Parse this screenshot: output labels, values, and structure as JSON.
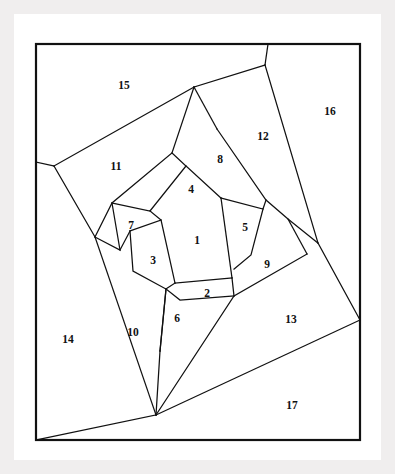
{
  "figure": {
    "background_color": "#f0eeee",
    "paper_color": "#ffffff",
    "line_color": "#111111",
    "region_count": 17,
    "frame": {
      "x": 36,
      "y": 44,
      "width": 324,
      "height": 396
    }
  },
  "chart_data": {
    "type": "diagram",
    "categories": [
      "1",
      "2",
      "3",
      "4",
      "5",
      "6",
      "7",
      "8",
      "9",
      "10",
      "11",
      "12",
      "13",
      "14",
      "15",
      "16",
      "17"
    ],
    "values": [
      1,
      2,
      3,
      4,
      5,
      6,
      7,
      8,
      9,
      10,
      11,
      12,
      13,
      14,
      15,
      16,
      17
    ],
    "xlabel": "",
    "ylabel": "",
    "grid": false,
    "legend": "none"
  },
  "regions": [
    {
      "id": "1",
      "label": "1",
      "label_x": 197,
      "label_y": 241,
      "points": "161,220 221,198 232,278 175,283"
    },
    {
      "id": "2",
      "label": "2",
      "label_x": 207,
      "label_y": 294,
      "points": "175,283 232,278 234,296 180,300 166,289"
    },
    {
      "id": "3",
      "label": "3",
      "label_x": 153,
      "label_y": 261,
      "points": "130,231 161,220 175,283 166,289 133,271"
    },
    {
      "id": "4",
      "label": "4",
      "label_x": 191,
      "label_y": 190,
      "points": "150,211 186,166 221,198 161,220"
    },
    {
      "id": "5",
      "label": "5",
      "label_x": 245,
      "label_y": 228,
      "points": "221,198 263,209 251,255 234,269"
    },
    {
      "id": "6",
      "label": "6",
      "label_x": 177,
      "label_y": 319,
      "points": "166,289 180,300 234,296 206,330 160,351"
    },
    {
      "id": "7",
      "label": "7",
      "label_x": 131,
      "label_y": 226,
      "points": "112,203 172,153 186,166 150,211 130,231 120,250"
    },
    {
      "id": "8",
      "label": "8",
      "label_x": 220,
      "label_y": 160,
      "points": "186,166 217,129 266,200 263,209 221,198"
    },
    {
      "id": "9",
      "label": "9",
      "label_x": 267,
      "label_y": 265,
      "points": "263,209 288,219 307,254 234,296 251,255"
    },
    {
      "id": "10",
      "label": "10",
      "label_x": 133,
      "label_y": 333,
      "points": "95,237 120,250 130,231 133,271 166,289 160,351 156,415"
    },
    {
      "id": "11",
      "label": "11",
      "label_x": 116,
      "label_y": 167,
      "points": "54,166 194,87 172,153 112,203 95,237"
    },
    {
      "id": "12",
      "label": "12",
      "label_x": 263,
      "label_y": 137,
      "points": "217,129 265,65 318,243 288,219 266,200"
    },
    {
      "id": "13",
      "label": "13",
      "label_x": 291,
      "label_y": 320,
      "points": "307,254 318,243 360,320 156,415"
    },
    {
      "id": "14",
      "label": "14",
      "label_x": 68,
      "label_y": 340,
      "points": "36,162 54,166 95,237 156,415 36,440"
    },
    {
      "id": "15",
      "label": "15",
      "label_x": 124,
      "label_y": 86,
      "points": "36,44 268,44 265,65 194,87 54,166 36,162"
    },
    {
      "id": "16",
      "label": "16",
      "label_x": 330,
      "label_y": 112,
      "points": "268,44 360,44 360,320 318,243 265,65"
    },
    {
      "id": "17",
      "label": "17",
      "label_x": 292,
      "label_y": 406,
      "points": "360,320 360,440 36,440 156,415"
    }
  ],
  "edges": [
    {
      "name": "frame-top",
      "d": "M36,44 L360,44"
    },
    {
      "name": "frame-right",
      "d": "M360,44 L360,440"
    },
    {
      "name": "frame-bottom",
      "d": "M360,440 L36,440"
    },
    {
      "name": "frame-left",
      "d": "M36,440 L36,44"
    },
    {
      "name": "edge-15-11",
      "d": "M54,166 L194,87"
    },
    {
      "name": "edge-15-12",
      "d": "M194,87 L265,65"
    },
    {
      "name": "edge-15-16",
      "d": "M265,65 L268,44"
    },
    {
      "name": "edge-12-16",
      "d": "M265,65 L318,243"
    },
    {
      "name": "edge-13-16",
      "d": "M318,243 L360,320"
    },
    {
      "name": "edge-13-17",
      "d": "M360,320 L156,415"
    },
    {
      "name": "edge-17-14",
      "d": "M156,415 L36,440"
    },
    {
      "name": "edge-14-11",
      "d": "M36,162 L54,166"
    },
    {
      "name": "edge-11-14-10",
      "d": "M54,166 L95,237"
    },
    {
      "name": "edge-10-14",
      "d": "M95,237 L156,415"
    },
    {
      "name": "edge-11-7",
      "d": "M194,87 L172,153 L112,203 L95,237"
    },
    {
      "name": "edge-12-8",
      "d": "M194,87 L217,129"
    },
    {
      "name": "edge-8-12-9",
      "d": "M217,129 L266,200 L288,219 L318,243"
    },
    {
      "name": "edge-9-13",
      "d": "M288,219 L307,254"
    },
    {
      "name": "edge-9-13-6",
      "d": "M307,254 L234,296 L156,415"
    },
    {
      "name": "edge-10-6",
      "d": "M160,351 L156,415"
    },
    {
      "name": "edge-7-3-10",
      "d": "M112,203 L120,250 L95,237"
    },
    {
      "name": "edge-7-4",
      "d": "M172,153 L186,166 L150,211 L112,203"
    },
    {
      "name": "edge-8-5",
      "d": "M266,200 L263,209 L221,198"
    },
    {
      "name": "edge-4-8-1",
      "d": "M186,166 L221,198"
    },
    {
      "name": "edge-1-4-3",
      "d": "M150,211 L161,220 L130,231"
    },
    {
      "name": "edge-3-10",
      "d": "M120,250 L130,231"
    },
    {
      "name": "edge-3-6",
      "d": "M130,231 L133,271 L166,289 L160,351"
    },
    {
      "name": "edge-1-3",
      "d": "M161,220 L175,283"
    },
    {
      "name": "edge-1-2",
      "d": "M175,283 L232,278"
    },
    {
      "name": "edge-1-5",
      "d": "M221,198 L232,278"
    },
    {
      "name": "edge-5-9",
      "d": "M263,209 L251,255 L234,269"
    },
    {
      "name": "edge-2-5-9",
      "d": "M232,278 L234,296"
    },
    {
      "name": "edge-2-6",
      "d": "M166,289 L180,300 L234,296"
    },
    {
      "name": "edge-2-3",
      "d": "M175,283 L166,289"
    },
    {
      "name": "edge-6-10",
      "d": "M166,289 L160,351"
    }
  ]
}
